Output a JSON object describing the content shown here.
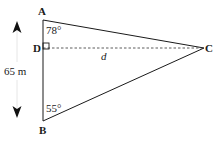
{
  "diagram": {
    "type": "geometry-triangle",
    "points": {
      "A": {
        "label": "A"
      },
      "B": {
        "label": "B"
      },
      "C": {
        "label": "C"
      },
      "D": {
        "label": "D"
      }
    },
    "angles": {
      "A": "78°",
      "B": "55°"
    },
    "segments": {
      "AB_length": "65 m",
      "DC_label": "d"
    },
    "right_angle_at": "D",
    "colors": {
      "line": "#1a1a1a",
      "dashed": "#333333",
      "arrow": "#111111",
      "arrow_shaft": "#e6e6e6"
    }
  }
}
